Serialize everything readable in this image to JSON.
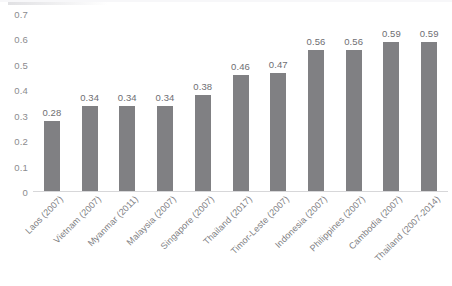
{
  "chart_data": {
    "type": "bar",
    "title": "",
    "subtitle": "",
    "xlabel": "",
    "ylabel": "",
    "categories": [
      "Laos (2007)",
      "Vietnam (2007)",
      "Myanmar (2011)",
      "Malaysia (2007)",
      "Singapore (2007)",
      "Thailand (2017)",
      "Timor-Leste (2007)",
      "Indonesia (2007)",
      "Philippines (2007)",
      "Cambodia (2007)",
      "Thailand (2007-2014)"
    ],
    "values": [
      0.28,
      0.34,
      0.34,
      0.34,
      0.38,
      0.46,
      0.47,
      0.56,
      0.56,
      0.59,
      0.59
    ],
    "data_labels": [
      "0.28",
      "0.34",
      "0.34",
      "0.34",
      "0.38",
      "0.46",
      "0.47",
      "0.56",
      "0.56",
      "0.59",
      "0.59"
    ],
    "ylim": [
      0,
      0.7
    ],
    "y_ticks": [
      0,
      0.1,
      0.2,
      0.3,
      0.4,
      0.5,
      0.6,
      0.7
    ],
    "y_tick_labels": [
      "0",
      "0.1",
      "0.2",
      "0.3",
      "0.4",
      "0.5",
      "0.6",
      "0.7"
    ],
    "grid": false,
    "legend": null,
    "legend_position": "none",
    "bar_color": "#808083",
    "axis_color": "#d7d7d9",
    "text_color": "#7e7e82",
    "background": "#ffffff",
    "x_tick_rotation": -45
  }
}
